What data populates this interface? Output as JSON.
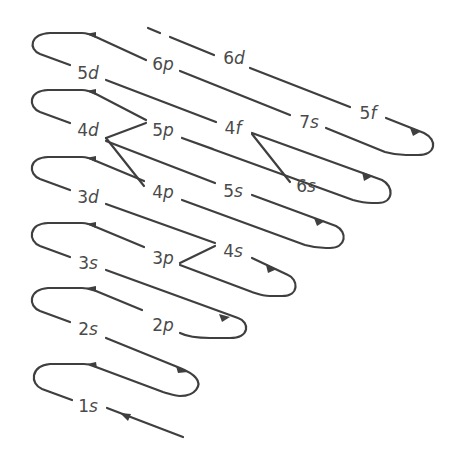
{
  "colors": {
    "stroke": "#3f3f3f",
    "text": "#4a4a4a",
    "background": "#ffffff"
  },
  "orbitals": [
    {
      "id": "1s",
      "n": "1",
      "l": "s",
      "x": 88,
      "y": 406
    },
    {
      "id": "2s",
      "n": "2",
      "l": "s",
      "x": 88,
      "y": 329
    },
    {
      "id": "2p",
      "n": "2",
      "l": "p",
      "x": 163,
      "y": 325
    },
    {
      "id": "3s",
      "n": "3",
      "l": "s",
      "x": 88,
      "y": 263
    },
    {
      "id": "3p",
      "n": "3",
      "l": "p",
      "x": 163,
      "y": 258
    },
    {
      "id": "4s",
      "n": "4",
      "l": "s",
      "x": 233,
      "y": 251
    },
    {
      "id": "3d",
      "n": "3",
      "l": "d",
      "x": 88,
      "y": 197
    },
    {
      "id": "4p",
      "n": "4",
      "l": "p",
      "x": 163,
      "y": 192
    },
    {
      "id": "5s",
      "n": "5",
      "l": "s",
      "x": 233,
      "y": 191
    },
    {
      "id": "6s",
      "n": "6",
      "l": "s",
      "x": 306,
      "y": 186
    },
    {
      "id": "4d",
      "n": "4",
      "l": "d",
      "x": 88,
      "y": 130
    },
    {
      "id": "5p",
      "n": "5",
      "l": "p",
      "x": 163,
      "y": 130
    },
    {
      "id": "4f",
      "n": "4",
      "l": "f",
      "x": 233,
      "y": 128
    },
    {
      "id": "7s",
      "n": "7",
      "l": "s",
      "x": 309,
      "y": 122
    },
    {
      "id": "5d",
      "n": "5",
      "l": "d",
      "x": 88,
      "y": 73
    },
    {
      "id": "6p",
      "n": "6",
      "l": "p",
      "x": 163,
      "y": 64
    },
    {
      "id": "6d",
      "n": "6",
      "l": "d",
      "x": 234,
      "y": 58
    },
    {
      "id": "5f",
      "n": "5",
      "l": "f",
      "x": 368,
      "y": 113
    }
  ],
  "filling_order": [
    "1s",
    "2s",
    "2p",
    "3s",
    "3p",
    "4s",
    "3d",
    "4p",
    "5s",
    "4d",
    "5p",
    "6s",
    "4f",
    "5d",
    "6p",
    "7s",
    "5f",
    "6d"
  ]
}
